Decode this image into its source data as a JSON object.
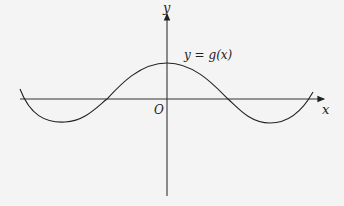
{
  "diagram": {
    "axes": {
      "x_label": "x",
      "y_label": "y",
      "origin_label": "O"
    },
    "curve": {
      "label": "y = g(x)",
      "shape": "cosine-like wave with maximum at origin, minima on either side"
    },
    "colors": {
      "background": "#f4f4f4",
      "stroke": "#222222"
    }
  }
}
